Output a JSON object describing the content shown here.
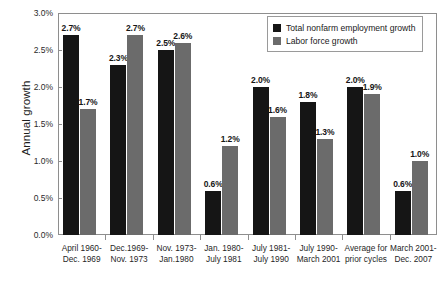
{
  "chart_data": {
    "type": "bar",
    "title": "",
    "xlabel": "",
    "ylabel": "Annual growth",
    "ylim": [
      0,
      3
    ],
    "ytick_labels": [
      "0.0%",
      "0.5%",
      "1.0%",
      "1.5%",
      "2.0%",
      "2.5%",
      "3.0%"
    ],
    "ytick_values": [
      0,
      0.5,
      1.0,
      1.5,
      2.0,
      2.5,
      3.0
    ],
    "grid": false,
    "legend_position": "top-right",
    "categories": [
      "April 1960-Dec. 1969",
      "Dec.1969-Nov. 1973",
      "Nov. 1973-Jan.1980",
      "Jan. 1980-July 1981",
      "July 1981-July 1990",
      "July 1990-March 2001",
      "Average for prior cycles",
      "March 2001-Dec. 2007"
    ],
    "category_lines": [
      [
        "April 1960-",
        "Dec. 1969"
      ],
      [
        "Dec.1969-",
        "Nov. 1973"
      ],
      [
        "Nov. 1973-",
        "Jan.1980"
      ],
      [
        "Jan. 1980-",
        "July 1981"
      ],
      [
        "July 1981-",
        "July 1990"
      ],
      [
        "July 1990-",
        "March 2001"
      ],
      [
        "Average for",
        "prior cycles"
      ],
      [
        "March 2001-",
        "Dec. 2007"
      ]
    ],
    "series": [
      {
        "name": "Total nonfarm employment growth",
        "color": "#151515",
        "values": [
          2.7,
          2.3,
          2.5,
          0.6,
          2.0,
          1.8,
          2.0,
          0.6
        ],
        "labels": [
          "2.7%",
          "2.3%",
          "2.5%",
          "0.6%",
          "2.0%",
          "1.8%",
          "2.0%",
          "0.6%"
        ]
      },
      {
        "name": "Labor force growth",
        "color": "#6b6b6b",
        "values": [
          1.7,
          2.7,
          2.6,
          1.2,
          1.6,
          1.3,
          1.9,
          1.0
        ],
        "labels": [
          "1.7%",
          "2.7%",
          "2.6%",
          "1.2%",
          "1.6%",
          "1.3%",
          "1.9%",
          "1.0%"
        ]
      }
    ]
  },
  "legend": {
    "items": [
      {
        "label": "Total nonfarm employment growth",
        "swatch": "black"
      },
      {
        "label": "Labor force growth",
        "swatch": "gray"
      }
    ]
  }
}
